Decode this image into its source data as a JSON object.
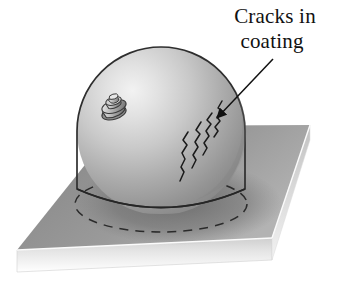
{
  "figure": {
    "title_lines": [
      "Cracks in",
      "coating"
    ],
    "label_line_1": "Cracks in",
    "label_line_2": "coating",
    "annotation_target": "cracks-on-dome-surface",
    "colors": {
      "background": "#ffffff",
      "dome_highlight": "#ebebeb",
      "dome_mid": "#bfbfbf",
      "dome_shadow": "#8d8d8d",
      "dome_outline": "#2b2b2b",
      "plate_top_light": "#b5b5b5",
      "plate_top_dark": "#7e7e7e",
      "plate_shadow": "#6e6e6e",
      "plate_edge_light": "#d9d9d9",
      "plate_edge_fade": "#ffffff",
      "crack_stroke": "#1a1a1a",
      "dashed_stroke": "#2b2b2b",
      "arrow_stroke": "#111111",
      "text": "#111111",
      "nozzle_light": "#d2d2d2",
      "nozzle_dark": "#7a7a7a"
    },
    "geometry": {
      "plate_corners": [
        [
          17,
          250
        ],
        [
          116,
          126
        ],
        [
          310,
          125
        ],
        [
          272,
          238
        ]
      ],
      "plate_thickness_px": 22,
      "dome_center": [
        161,
        131
      ],
      "dome_radius_px": 84,
      "dome_base_y": 205,
      "contact_ellipse_rx": 86,
      "contact_ellipse_ry": 28,
      "nozzle_position": [
        113,
        105
      ],
      "arrow_from": [
        272,
        60
      ],
      "arrow_to": [
        215,
        119
      ],
      "crack_count": 4
    }
  }
}
